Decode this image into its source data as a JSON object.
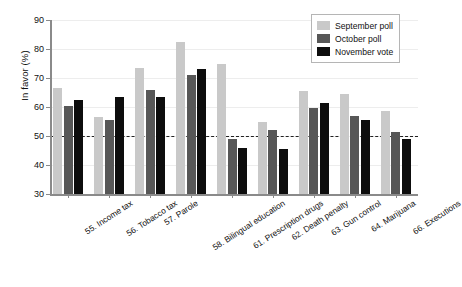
{
  "chart_data": {
    "type": "bar",
    "title": "",
    "xlabel": "",
    "ylabel": "In favor (%)",
    "ylim": [
      30,
      90
    ],
    "yticks": [
      30,
      40,
      50,
      60,
      70,
      80,
      90
    ],
    "grid": true,
    "legend_position": "top-right",
    "reference_line": {
      "value": 50,
      "style": "dashed",
      "color": "#222222"
    },
    "categories": [
      "55. Income tax",
      "56. Tobacco tax",
      "57. Parole",
      "58. Bilingual education",
      "61. Prescription drugs",
      "62. Death penalty",
      "63. Gun control",
      "64. Marijuana",
      "66. Executions"
    ],
    "series": [
      {
        "name": "September poll",
        "color": "#c9c9c9",
        "values": [
          66.5,
          56.5,
          73.5,
          82.5,
          75.0,
          55.0,
          65.5,
          64.5,
          58.5
        ]
      },
      {
        "name": "October poll",
        "color": "#575757",
        "values": [
          60.5,
          55.5,
          66.0,
          71.0,
          49.0,
          52.0,
          59.5,
          57.0,
          51.5
        ]
      },
      {
        "name": "November vote",
        "color": "#0d0d0d",
        "values": [
          62.5,
          63.5,
          63.5,
          73.0,
          46.0,
          45.5,
          61.5,
          55.5,
          49.0
        ]
      }
    ]
  },
  "legend": {
    "items": [
      {
        "label": "September poll"
      },
      {
        "label": "October poll"
      },
      {
        "label": "November vote"
      }
    ]
  }
}
